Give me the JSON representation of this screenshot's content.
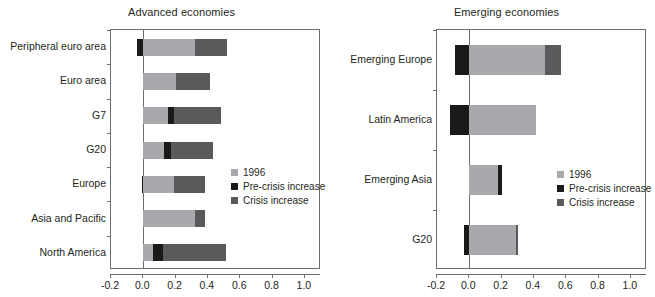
{
  "figure": {
    "panels": [
      {
        "id": "advanced",
        "title": "Advanced economies",
        "legend": [
          {
            "label": "1996",
            "color": "#a7a9ac",
            "key": "base"
          },
          {
            "label": "Pre-crisis increase",
            "color": "#1a1a1a",
            "key": "pre"
          },
          {
            "label": "Crisis increase",
            "color": "#595a5c",
            "key": "crisis"
          }
        ],
        "chart_data": {
          "type": "bar",
          "orientation": "horizontal",
          "stacked": true,
          "title": "Advanced economies",
          "xlabel": "",
          "ylabel": "",
          "xlim": [
            -0.2,
            1.1
          ],
          "xticks": [
            -0.2,
            0.0,
            0.2,
            0.4,
            0.6,
            0.8,
            1.0
          ],
          "xticklabels": [
            "-0.2",
            "0.0",
            "0.2",
            "0.4",
            "0.6",
            "0.8",
            "1.0"
          ],
          "grid": false,
          "legend_position": "center-right",
          "categories": [
            "Peripheral euro area",
            "Euro area",
            "G7",
            "G20",
            "Europe",
            "Asia and Pacific",
            "North America"
          ],
          "series": [
            {
              "name": "1996",
              "color": "#a7a9ac",
              "values": [
                0.32,
                0.2,
                0.15,
                0.13,
                0.19,
                0.32,
                0.06
              ]
            },
            {
              "name": "Pre-crisis increase",
              "color": "#1a1a1a",
              "values": [
                -0.04,
                0.0,
                0.04,
                0.04,
                -0.01,
                0.0,
                0.06
              ]
            },
            {
              "name": "Crisis increase",
              "color": "#595a5c",
              "values": [
                0.2,
                0.21,
                0.29,
                0.26,
                0.19,
                0.06,
                0.39
              ]
            }
          ],
          "bar_segments": [
            {
              "category": "Peripheral euro area",
              "segments": [
                {
                  "key": "pre",
                  "start": -0.04,
                  "end": 0.0
                },
                {
                  "key": "base",
                  "start": 0.0,
                  "end": 0.32
                },
                {
                  "key": "crisis",
                  "start": 0.32,
                  "end": 0.52
                }
              ]
            },
            {
              "category": "Euro area",
              "segments": [
                {
                  "key": "base",
                  "start": 0.0,
                  "end": 0.2
                },
                {
                  "key": "crisis",
                  "start": 0.2,
                  "end": 0.41
                }
              ]
            },
            {
              "category": "G7",
              "segments": [
                {
                  "key": "base",
                  "start": 0.0,
                  "end": 0.15
                },
                {
                  "key": "pre",
                  "start": 0.15,
                  "end": 0.19
                },
                {
                  "key": "crisis",
                  "start": 0.19,
                  "end": 0.48
                }
              ]
            },
            {
              "category": "G20",
              "segments": [
                {
                  "key": "base",
                  "start": 0.0,
                  "end": 0.13
                },
                {
                  "key": "pre",
                  "start": 0.13,
                  "end": 0.17
                },
                {
                  "key": "crisis",
                  "start": 0.17,
                  "end": 0.43
                }
              ]
            },
            {
              "category": "Europe",
              "segments": [
                {
                  "key": "pre",
                  "start": -0.01,
                  "end": 0.0
                },
                {
                  "key": "base",
                  "start": 0.0,
                  "end": 0.19
                },
                {
                  "key": "crisis",
                  "start": 0.19,
                  "end": 0.38
                }
              ]
            },
            {
              "category": "Asia and Pacific",
              "segments": [
                {
                  "key": "base",
                  "start": 0.0,
                  "end": 0.32
                },
                {
                  "key": "crisis",
                  "start": 0.32,
                  "end": 0.38
                }
              ]
            },
            {
              "category": "North America",
              "segments": [
                {
                  "key": "base",
                  "start": 0.0,
                  "end": 0.06
                },
                {
                  "key": "pre",
                  "start": 0.06,
                  "end": 0.12
                },
                {
                  "key": "crisis",
                  "start": 0.12,
                  "end": 0.51
                }
              ]
            }
          ]
        }
      },
      {
        "id": "emerging",
        "title": "Emerging economies",
        "legend": [
          {
            "label": "1996",
            "color": "#a7a9ac",
            "key": "base"
          },
          {
            "label": "Pre-crisis increase",
            "color": "#1a1a1a",
            "key": "pre"
          },
          {
            "label": "Crisis increase",
            "color": "#595a5c",
            "key": "crisis"
          }
        ],
        "chart_data": {
          "type": "bar",
          "orientation": "horizontal",
          "stacked": true,
          "title": "Emerging economies",
          "xlabel": "",
          "ylabel": "",
          "xlim": [
            -0.2,
            1.1
          ],
          "xticks": [
            -0.2,
            0.0,
            0.2,
            0.4,
            0.6,
            0.8,
            1.0
          ],
          "xticklabels": [
            "-0.2",
            "0.0",
            "0.2",
            "0.4",
            "0.6",
            "0.8",
            "1.0"
          ],
          "grid": false,
          "legend_position": "center-right",
          "categories": [
            "Emerging Europe",
            "Latin America",
            "Emerging Asia",
            "G20"
          ],
          "series": [
            {
              "name": "1996",
              "color": "#a7a9ac",
              "values": [
                0.47,
                0.41,
                0.18,
                0.29
              ]
            },
            {
              "name": "Pre-crisis increase",
              "color": "#1a1a1a",
              "values": [
                -0.09,
                -0.12,
                0.02,
                -0.03
              ]
            },
            {
              "name": "Crisis increase",
              "color": "#595a5c",
              "values": [
                0.1,
                0.0,
                0.0,
                0.01
              ]
            }
          ],
          "bar_segments": [
            {
              "category": "Emerging Europe",
              "segments": [
                {
                  "key": "pre",
                  "start": -0.09,
                  "end": 0.0
                },
                {
                  "key": "base",
                  "start": 0.0,
                  "end": 0.47
                },
                {
                  "key": "crisis",
                  "start": 0.47,
                  "end": 0.57
                }
              ]
            },
            {
              "category": "Latin America",
              "segments": [
                {
                  "key": "pre",
                  "start": -0.12,
                  "end": 0.0
                },
                {
                  "key": "base",
                  "start": 0.0,
                  "end": 0.41
                }
              ]
            },
            {
              "category": "Emerging Asia",
              "segments": [
                {
                  "key": "base",
                  "start": 0.0,
                  "end": 0.18
                },
                {
                  "key": "pre",
                  "start": 0.18,
                  "end": 0.2
                }
              ]
            },
            {
              "category": "G20",
              "segments": [
                {
                  "key": "pre",
                  "start": -0.03,
                  "end": 0.0
                },
                {
                  "key": "base",
                  "start": 0.0,
                  "end": 0.29
                },
                {
                  "key": "crisis",
                  "start": 0.29,
                  "end": 0.3
                }
              ]
            }
          ]
        }
      }
    ],
    "colors": {
      "base": "#a7a9ac",
      "pre": "#1a1a1a",
      "crisis": "#595a5c",
      "axis": "#6d6e71",
      "text": "#231f20",
      "background": "#ffffff"
    }
  }
}
